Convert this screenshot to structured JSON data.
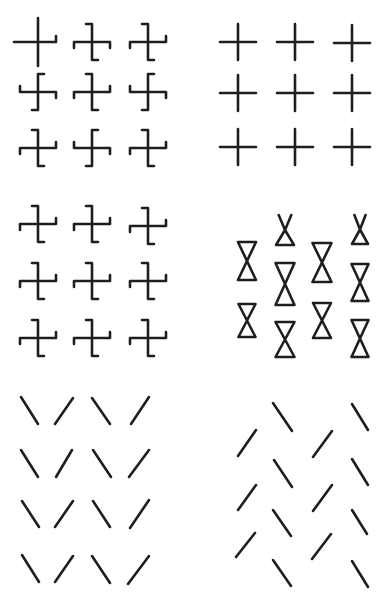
{
  "figure": {
    "type": "gestalt-texture-segregation-stimuli",
    "background": "#ffffff",
    "ink": "#1e1e1e",
    "panels": [
      {
        "id": "A",
        "position": "top-left",
        "element": "hooked-cross",
        "grid": "3x3",
        "arm": 18,
        "hook": 6,
        "items": [
          {
            "cx": 38,
            "cy": 42,
            "hooks": [
              "up",
              "down",
              "left",
              "up"
            ]
          },
          {
            "cx": 92,
            "cy": 42,
            "hooks": [
              "left",
              "right",
              "down",
              "down"
            ]
          },
          {
            "cx": 148,
            "cy": 42,
            "hooks": [
              "left",
              "right",
              "down",
              "up"
            ]
          },
          {
            "cx": 38,
            "cy": 92,
            "hooks": [
              "right",
              "left",
              "up",
              "down"
            ]
          },
          {
            "cx": 92,
            "cy": 92,
            "hooks": [
              "left",
              "right",
              "down",
              "up"
            ]
          },
          {
            "cx": 148,
            "cy": 92,
            "hooks": [
              "right",
              "left",
              "up",
              "down"
            ]
          },
          {
            "cx": 38,
            "cy": 148,
            "hooks": [
              "left",
              "right",
              "down",
              "up"
            ]
          },
          {
            "cx": 92,
            "cy": 148,
            "hooks": [
              "right",
              "left",
              "up",
              "down"
            ]
          },
          {
            "cx": 148,
            "cy": 148,
            "hooks": [
              "left",
              "right",
              "down",
              "up"
            ]
          }
        ]
      },
      {
        "id": "B",
        "position": "top-right",
        "element": "plain-cross",
        "grid": "3x3",
        "arm": 18,
        "items": [
          {
            "cx": 238,
            "cy": 42
          },
          {
            "cx": 295,
            "cy": 42
          },
          {
            "cx": 352,
            "cy": 43
          },
          {
            "cx": 238,
            "cy": 93
          },
          {
            "cx": 295,
            "cy": 93
          },
          {
            "cx": 352,
            "cy": 93
          },
          {
            "cx": 238,
            "cy": 147
          },
          {
            "cx": 295,
            "cy": 147
          },
          {
            "cx": 352,
            "cy": 147
          }
        ]
      },
      {
        "id": "C",
        "position": "middle-left",
        "element": "hooked-cross",
        "grid": "3x3",
        "arm": 18,
        "hook": 6,
        "items": [
          {
            "cx": 38,
            "cy": 224,
            "hooks": [
              "left",
              "right",
              "down",
              "up"
            ]
          },
          {
            "cx": 92,
            "cy": 224,
            "hooks": [
              "left",
              "right",
              "down",
              "up"
            ]
          },
          {
            "cx": 148,
            "cy": 226,
            "hooks": [
              "left",
              "right",
              "down",
              "up"
            ]
          },
          {
            "cx": 38,
            "cy": 281,
            "hooks": [
              "left",
              "right",
              "down",
              "up"
            ]
          },
          {
            "cx": 92,
            "cy": 281,
            "hooks": [
              "left",
              "right",
              "down",
              "up"
            ]
          },
          {
            "cx": 148,
            "cy": 281,
            "hooks": [
              "left",
              "right",
              "down",
              "up"
            ]
          },
          {
            "cx": 38,
            "cy": 338,
            "hooks": [
              "left",
              "right",
              "down",
              "up"
            ]
          },
          {
            "cx": 92,
            "cy": 338,
            "hooks": [
              "left",
              "right",
              "down",
              "up"
            ]
          },
          {
            "cx": 148,
            "cy": 338,
            "hooks": [
              "left",
              "right",
              "down",
              "up"
            ]
          }
        ]
      },
      {
        "id": "D",
        "position": "middle-right",
        "element": "hourglass",
        "items": [
          {
            "cx": 247,
            "top": 242,
            "bottom": 280,
            "w": 18,
            "kind": "full"
          },
          {
            "cx": 247,
            "top": 304,
            "bottom": 337,
            "w": 17,
            "kind": "full"
          },
          {
            "cx": 285,
            "top": 215,
            "bottom": 245,
            "w": 18,
            "kind": "x-top"
          },
          {
            "cx": 285,
            "top": 263,
            "bottom": 305,
            "w": 19,
            "kind": "full"
          },
          {
            "cx": 285,
            "top": 322,
            "bottom": 357,
            "w": 19,
            "kind": "full"
          },
          {
            "cx": 322,
            "top": 243,
            "bottom": 282,
            "w": 19,
            "kind": "full"
          },
          {
            "cx": 322,
            "top": 303,
            "bottom": 338,
            "w": 18,
            "kind": "full"
          },
          {
            "cx": 360,
            "top": 215,
            "bottom": 244,
            "w": 16,
            "kind": "x-top"
          },
          {
            "cx": 360,
            "top": 264,
            "bottom": 301,
            "w": 17,
            "kind": "full"
          },
          {
            "cx": 360,
            "top": 320,
            "bottom": 357,
            "w": 17,
            "kind": "full"
          }
        ]
      },
      {
        "id": "E",
        "position": "bottom-left",
        "element": "line-segment",
        "grid": "4x4",
        "pattern": [
          "\\",
          "/",
          "\\",
          "/"
        ],
        "items": [
          {
            "x1": 21,
            "y1": 397,
            "x2": 38,
            "y2": 424
          },
          {
            "x1": 73,
            "y1": 398,
            "x2": 55,
            "y2": 424
          },
          {
            "x1": 92,
            "y1": 398,
            "x2": 110,
            "y2": 424
          },
          {
            "x1": 149,
            "y1": 397,
            "x2": 131,
            "y2": 424
          },
          {
            "x1": 21,
            "y1": 450,
            "x2": 38,
            "y2": 477
          },
          {
            "x1": 72,
            "y1": 450,
            "x2": 56,
            "y2": 477
          },
          {
            "x1": 93,
            "y1": 450,
            "x2": 111,
            "y2": 477
          },
          {
            "x1": 149,
            "y1": 450,
            "x2": 129,
            "y2": 477
          },
          {
            "x1": 22,
            "y1": 501,
            "x2": 39,
            "y2": 527
          },
          {
            "x1": 73,
            "y1": 501,
            "x2": 55,
            "y2": 527
          },
          {
            "x1": 93,
            "y1": 501,
            "x2": 110,
            "y2": 527
          },
          {
            "x1": 149,
            "y1": 500,
            "x2": 130,
            "y2": 528
          },
          {
            "x1": 22,
            "y1": 555,
            "x2": 39,
            "y2": 582
          },
          {
            "x1": 73,
            "y1": 556,
            "x2": 55,
            "y2": 582
          },
          {
            "x1": 92,
            "y1": 556,
            "x2": 110,
            "y2": 583
          },
          {
            "x1": 149,
            "y1": 556,
            "x2": 128,
            "y2": 584
          }
        ]
      },
      {
        "id": "F",
        "position": "bottom-right",
        "element": "line-segment",
        "arrangement": "staggered-columns",
        "items": [
          {
            "x1": 256,
            "y1": 430,
            "x2": 238,
            "y2": 456
          },
          {
            "x1": 256,
            "y1": 485,
            "x2": 238,
            "y2": 510
          },
          {
            "x1": 255,
            "y1": 533,
            "x2": 236,
            "y2": 557
          },
          {
            "x1": 273,
            "y1": 403,
            "x2": 292,
            "y2": 431
          },
          {
            "x1": 274,
            "y1": 460,
            "x2": 292,
            "y2": 487
          },
          {
            "x1": 273,
            "y1": 510,
            "x2": 291,
            "y2": 536
          },
          {
            "x1": 273,
            "y1": 560,
            "x2": 291,
            "y2": 586
          },
          {
            "x1": 332,
            "y1": 431,
            "x2": 313,
            "y2": 457
          },
          {
            "x1": 332,
            "y1": 485,
            "x2": 313,
            "y2": 511
          },
          {
            "x1": 331,
            "y1": 534,
            "x2": 312,
            "y2": 559
          },
          {
            "x1": 352,
            "y1": 404,
            "x2": 368,
            "y2": 430
          },
          {
            "x1": 352,
            "y1": 459,
            "x2": 368,
            "y2": 485
          },
          {
            "x1": 352,
            "y1": 510,
            "x2": 367,
            "y2": 534
          },
          {
            "x1": 352,
            "y1": 561,
            "x2": 368,
            "y2": 587
          }
        ]
      }
    ]
  }
}
